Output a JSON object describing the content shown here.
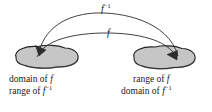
{
  "figure": {
    "background_color": "#ffffff",
    "ink_color": "#1a1a1a",
    "blob_fill_color": "#c6c6c6",
    "blob_stroke_color": "#222222"
  },
  "arcs": {
    "upper": {
      "label_function": "f",
      "label_exponent": "−1",
      "direction": "right-to-left"
    },
    "lower": {
      "label_function": "f",
      "label_exponent": "",
      "direction": "left-to-right"
    }
  },
  "sets": {
    "left": {
      "name": "domain-of-f-set",
      "caption_line1_prefix": "domain of ",
      "caption_line1_function": "f",
      "caption_line2_prefix": "range of ",
      "caption_line2_function": "f",
      "caption_line2_exponent": "−1"
    },
    "right": {
      "name": "range-of-f-set",
      "caption_line1_prefix": "range of ",
      "caption_line1_function": "f",
      "caption_line2_prefix": "domain of ",
      "caption_line2_function": "f",
      "caption_line2_exponent": "−1"
    }
  }
}
